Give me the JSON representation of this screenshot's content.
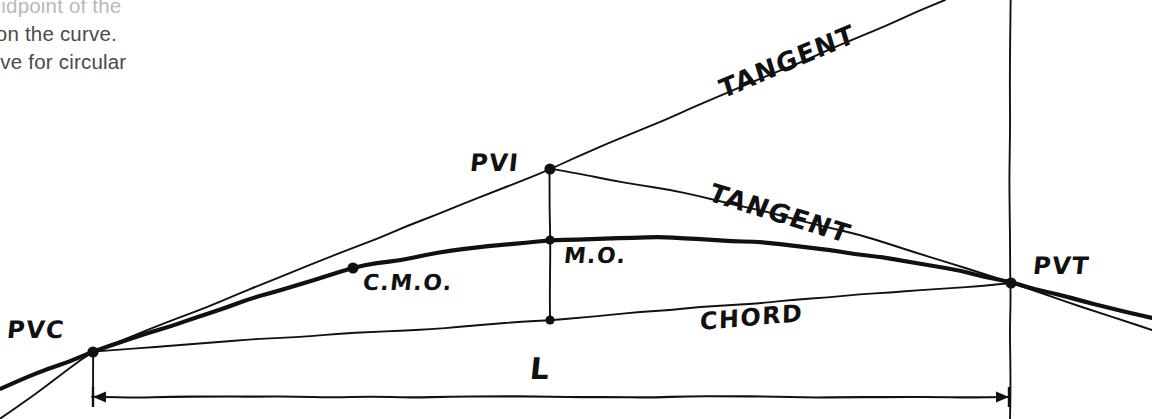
{
  "page": {
    "width": 1152,
    "height": 419,
    "background": "#ffffff",
    "ink": "#111111",
    "body_text_color": "#4a4a4a"
  },
  "body_text": {
    "line1": "midpoint of the",
    "line2": "t on the curve.",
    "line3": "olve for  circular"
  },
  "labels": {
    "pvc": "PVC",
    "pvi": "PVI",
    "pvt": "PVT",
    "cmo": "C.M.O.",
    "mo": "M.O.",
    "tangent_upper": "TANGENT",
    "tangent_lower": "TANGENT",
    "chord": "CHORD",
    "length": "L"
  },
  "chart_data": {
    "type": "line",
    "xlabel": "",
    "ylabel": "",
    "xlim": [
      0,
      1152
    ],
    "ylim": [
      419,
      0
    ],
    "grid": false,
    "legend_position": "none",
    "points": [
      {
        "name": "PVC",
        "label": "PVC",
        "x": 93,
        "y": 352,
        "marker": "filled-dot",
        "label_dx": -86,
        "label_dy": -22
      },
      {
        "name": "PVI",
        "label": "PVI",
        "x": 550,
        "y": 169,
        "marker": "filled-dot",
        "label_dx": -80,
        "label_dy": -6
      },
      {
        "name": "PVT",
        "label": "PVT",
        "x": 1011,
        "y": 283,
        "marker": "filled-dot",
        "label_dx": 22,
        "label_dy": -17
      },
      {
        "name": "CMO",
        "label": "C.M.O.",
        "x": 353,
        "y": 268,
        "marker": "filled-dot",
        "label_dx": 10,
        "label_dy": 14
      },
      {
        "name": "MO",
        "label": "M.O.",
        "x": 550,
        "y": 240,
        "marker": "filled-dot",
        "label_dx": 14,
        "label_dy": 15
      },
      {
        "name": "CHORD_MID",
        "label": "",
        "x": 550,
        "y": 320,
        "marker": "filled-dot",
        "label_dx": 0,
        "label_dy": 0
      }
    ],
    "series": [
      {
        "name": "back-tangent",
        "style": "thin",
        "path": [
          [
            0,
            419
          ],
          [
            93,
            352
          ],
          [
            550,
            169
          ],
          [
            945,
            0
          ]
        ]
      },
      {
        "name": "forward-tangent",
        "style": "thin",
        "path": [
          [
            550,
            169
          ],
          [
            700,
            196
          ],
          [
            860,
            235
          ],
          [
            1011,
            283
          ],
          [
            1152,
            330
          ]
        ]
      },
      {
        "name": "parabolic-curve",
        "style": "thick",
        "path": [
          [
            0,
            388
          ],
          [
            93,
            352
          ],
          [
            250,
            299
          ],
          [
            353,
            268
          ],
          [
            450,
            251
          ],
          [
            550,
            240
          ],
          [
            660,
            236
          ],
          [
            780,
            244
          ],
          [
            880,
            257
          ],
          [
            960,
            271
          ],
          [
            1011,
            283
          ],
          [
            1152,
            318
          ]
        ]
      },
      {
        "name": "chord",
        "style": "thin",
        "path": [
          [
            93,
            352
          ],
          [
            250,
            339
          ],
          [
            400,
            331
          ],
          [
            550,
            320
          ],
          [
            700,
            307
          ],
          [
            860,
            295
          ],
          [
            1011,
            283
          ]
        ]
      },
      {
        "name": "mid-ordinate-vertical",
        "style": "thin",
        "path": [
          [
            550,
            169
          ],
          [
            550,
            240
          ],
          [
            550,
            320
          ]
        ]
      },
      {
        "name": "pvt-station-vertical",
        "style": "thin",
        "path": [
          [
            1010,
            0
          ],
          [
            1010,
            419
          ]
        ]
      },
      {
        "name": "pvc-extension-vertical",
        "style": "thin",
        "path": [
          [
            93,
            352
          ],
          [
            93,
            405
          ]
        ]
      }
    ],
    "dimension": {
      "label": "L",
      "label_x": 530,
      "label_y": 368,
      "y": 397,
      "x_start": 93,
      "x_end": 1009,
      "arrow_left": true,
      "arrow_right": true,
      "description": "Curve length L measured horizontally from PVC station to PVT station"
    },
    "annotations": [
      {
        "text": "TANGENT",
        "x": 720,
        "y": 90,
        "rotation": -23,
        "target": "back-tangent"
      },
      {
        "text": "TANGENT",
        "x": 710,
        "y": 192,
        "rotation": 17,
        "target": "forward-tangent"
      },
      {
        "text": "CHORD",
        "x": 700,
        "y": 322,
        "rotation": -5,
        "target": "chord"
      }
    ]
  }
}
